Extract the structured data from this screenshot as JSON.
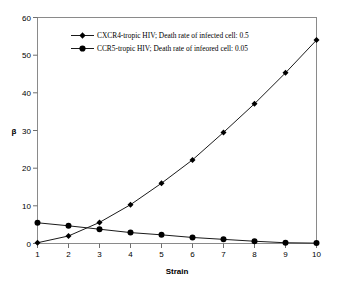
{
  "chart_data": {
    "type": "line",
    "title": "",
    "xlabel": "Strain",
    "ylabel": "β",
    "x": [
      1,
      2,
      3,
      4,
      5,
      6,
      7,
      8,
      9,
      10
    ],
    "xlim": [
      1,
      10
    ],
    "ylim": [
      0,
      60
    ],
    "grid": false,
    "legend_position": "inside-top-left",
    "xticks": [
      "1",
      "2",
      "3",
      "4",
      "5",
      "6",
      "7",
      "8",
      "9",
      "10"
    ],
    "yticks": [
      "0",
      "10",
      "20",
      "30",
      "40",
      "50",
      "60"
    ],
    "series": [
      {
        "name": "CXCR4-tropic HIV; Death rate of infected cell: 0.5",
        "marker": "diamond",
        "color": "#000000",
        "values": [
          0.2,
          2.0,
          5.6,
          10.3,
          16.0,
          22.2,
          29.5,
          37.1,
          45.3,
          54.0
        ]
      },
      {
        "name": "CCR5-tropic HIV; Death rate of infeored cell: 0.05",
        "marker": "circle",
        "color": "#000000",
        "values": [
          5.5,
          4.7,
          3.8,
          2.9,
          2.3,
          1.6,
          1.1,
          0.6,
          0.2,
          0.1
        ]
      }
    ]
  },
  "legend": {
    "entries": [
      {
        "label": "CXCR4-tropic HIV; Death rate of infected cell: 0.5"
      },
      {
        "label": "CCR5-tropic HIV; Death rate of infeored cell: 0.05"
      }
    ]
  },
  "axes": {
    "x_title": "Strain",
    "y_title": "β",
    "x_tick_labels": [
      "1",
      "2",
      "3",
      "4",
      "5",
      "6",
      "7",
      "8",
      "9",
      "10"
    ],
    "y_tick_labels": [
      "0",
      "10",
      "20",
      "30",
      "40",
      "50",
      "60"
    ]
  }
}
